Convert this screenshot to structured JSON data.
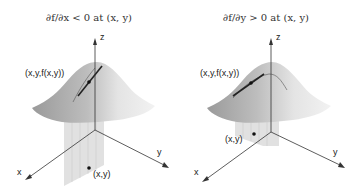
{
  "panels": [
    {
      "title": "∂f/∂x < 0 at (x, y)",
      "labels": {
        "z_axis": "z",
        "x_axis": "x",
        "y_axis": "y",
        "surface_point": "(x,y,f(x,y))",
        "base_point": "(x,y)"
      },
      "slice_direction": "x"
    },
    {
      "title": "∂f/∂y > 0 at (x, y)",
      "labels": {
        "z_axis": "z",
        "x_axis": "x",
        "y_axis": "y",
        "surface_point": "(x,y,f(x,y))",
        "base_point": "(x,y)"
      },
      "slice_direction": "y"
    }
  ],
  "colors": {
    "axis": "#333333",
    "surface_light": "#eeeeee",
    "surface_dark": "#8a8a8a",
    "slice_plane": "#d8d8d8",
    "tangent": "#222222"
  }
}
